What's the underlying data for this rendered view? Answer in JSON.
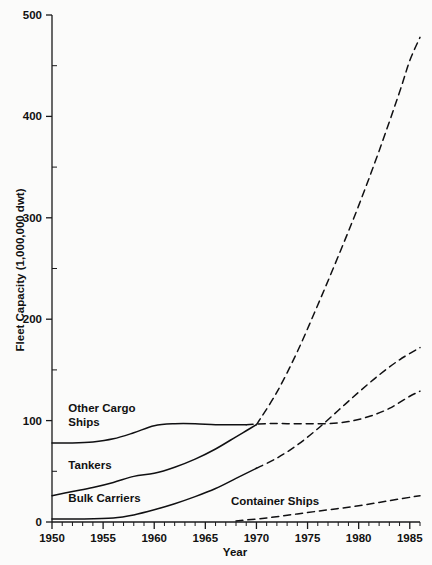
{
  "chart_data": {
    "type": "line",
    "title": "",
    "xlabel": "Year",
    "ylabel": "Fleet Capacity (1,000,000 dwt)",
    "xlim": [
      1950,
      1986
    ],
    "ylim": [
      0,
      500
    ],
    "grid": false,
    "legend": "inline-labels",
    "x_major_ticks": [
      1950,
      1955,
      1960,
      1965,
      1970,
      1975,
      1980,
      1985
    ],
    "x_minor_tick_step": 1,
    "y_major_ticks": [
      0,
      100,
      200,
      300,
      400,
      500
    ],
    "y_minor_ticks": [
      50,
      150,
      250,
      350,
      450
    ],
    "x_tick_labels": [
      "1950",
      "1955",
      "1960",
      "1965",
      "1970",
      "1975",
      "1980",
      "1985"
    ],
    "y_tick_labels": [
      "0",
      "100",
      "200",
      "300",
      "400",
      "500"
    ],
    "projection_note": "Dashed segments are projections beginning about 1969-1970",
    "series": [
      {
        "name": "Other Cargo Ships",
        "label": "Other Cargo Ships",
        "label_lines": [
          "Other Cargo",
          "Ships"
        ],
        "style_historical": "solid",
        "style_projected": "dashed",
        "historical": {
          "x": [
            1950,
            1952,
            1954,
            1956,
            1958,
            1960,
            1962,
            1964,
            1966,
            1968,
            1969
          ],
          "y": [
            78,
            78,
            79,
            82,
            88,
            95,
            97,
            97,
            96,
            96,
            96
          ]
        },
        "projected": {
          "x": [
            1969,
            1971,
            1973,
            1975,
            1977,
            1979,
            1981,
            1983,
            1985,
            1986
          ],
          "y": [
            96,
            97,
            97,
            97,
            97,
            99,
            104,
            112,
            124,
            129
          ]
        }
      },
      {
        "name": "Tankers",
        "label": "Tankers",
        "label_lines": [
          "Tankers"
        ],
        "style_historical": "solid",
        "style_projected": "dashed",
        "historical": {
          "x": [
            1950,
            1952,
            1954,
            1956,
            1958,
            1960,
            1962,
            1964,
            1966,
            1968,
            1969,
            1970
          ],
          "y": [
            26,
            30,
            34,
            39,
            45,
            48,
            54,
            62,
            72,
            84,
            90,
            96
          ]
        },
        "projected": {
          "x": [
            1970,
            1972,
            1974,
            1976,
            1978,
            1980,
            1982,
            1984,
            1985,
            1986
          ],
          "y": [
            96,
            128,
            168,
            214,
            262,
            312,
            366,
            424,
            455,
            478
          ]
        }
      },
      {
        "name": "Bulk Carriers",
        "label": "Bulk Carriers",
        "label_lines": [
          "Bulk Carriers"
        ],
        "style_historical": "solid",
        "style_projected": "dashed",
        "historical": {
          "x": [
            1950,
            1953,
            1956,
            1958,
            1960,
            1962,
            1964,
            1966,
            1968,
            1970
          ],
          "y": [
            3,
            3,
            4,
            7,
            12,
            18,
            25,
            33,
            43,
            53
          ]
        },
        "projected": {
          "x": [
            1970,
            1972,
            1974,
            1976,
            1978,
            1980,
            1982,
            1984,
            1986
          ],
          "y": [
            53,
            63,
            76,
            92,
            110,
            128,
            145,
            160,
            172
          ]
        }
      },
      {
        "name": "Container Ships",
        "label": "Container Ships",
        "label_lines": [
          "Container Ships"
        ],
        "style_historical": "none",
        "style_projected": "dashed",
        "historical": {
          "x": [],
          "y": []
        },
        "projected": {
          "x": [
            1968,
            1971,
            1974,
            1977,
            1980,
            1983,
            1986
          ],
          "y": [
            1,
            4,
            8,
            12,
            16,
            21,
            26
          ]
        }
      }
    ],
    "annotations": [
      {
        "text": "Other Cargo Ships",
        "x": 1951.6,
        "y": 108
      },
      {
        "text": "Tankers",
        "x": 1951.6,
        "y": 52
      },
      {
        "text": "Bulk Carriers",
        "x": 1951.6,
        "y": 20
      },
      {
        "text": "Container Ships",
        "x": 1967.5,
        "y": 17
      }
    ],
    "colors": {
      "line": "#101012",
      "axis": "#18181a",
      "background": "#fbfbfa",
      "text": "#111111"
    }
  }
}
